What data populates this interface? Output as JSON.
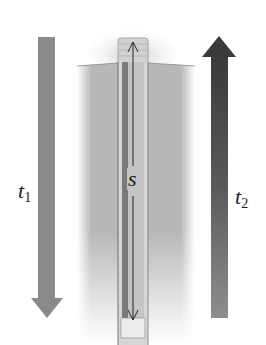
{
  "diagram": {
    "labels": {
      "left_arrow": {
        "base": "t",
        "sub": "1"
      },
      "center": {
        "base": "s"
      },
      "right_arrow": {
        "base": "t",
        "sub": "2"
      }
    },
    "arrows": [
      {
        "id": "t1",
        "direction": "down",
        "color": "#8a8a8a"
      },
      {
        "id": "t2",
        "direction": "up",
        "color_top": "#3a3a3a",
        "color_bottom": "#8c8c8c"
      }
    ],
    "colors": {
      "ground": "#b4b4b4",
      "pipe_outer": "#d8d8d8",
      "pipe_inner": "#9a9a9a",
      "pipe_line": "#333333",
      "background": "#ffffff"
    }
  }
}
